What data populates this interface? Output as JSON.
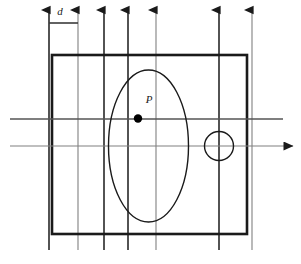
{
  "figure": {
    "labels": {
      "spacing_label": "d",
      "point_label": "P"
    },
    "colors": {
      "heavy_stroke": "#1a1a1a",
      "light_stroke": "#808080",
      "medium_stroke": "#555555",
      "point_fill": "#000000",
      "background": "#ffffff"
    },
    "canvas": {
      "width": 301,
      "height": 264
    },
    "boundary_rect": {
      "name": "outer-boundary-rectangle",
      "x": 52,
      "y": 55,
      "width": 195,
      "height": 179,
      "stroke_width": 2.6
    },
    "ellipse": {
      "name": "ellipse-region",
      "cx": 148.5,
      "cy": 146,
      "rx": 40,
      "ry": 76,
      "stroke_width": 1.4
    },
    "hole_circle": {
      "name": "circular-hole",
      "cx": 219,
      "cy": 146,
      "r": 14.5,
      "stroke_width": 1.4
    },
    "point": {
      "name": "sample-point-P",
      "cx": 138,
      "cy": 118.5,
      "r": 4.2,
      "label_x": 149,
      "label_y": 103
    },
    "vertical_arrows": [
      {
        "x": 49,
        "top": 10,
        "bottom": 250,
        "weight": "heavy"
      },
      {
        "x": 78,
        "top": 10,
        "bottom": 250,
        "weight": "light"
      },
      {
        "x": 104,
        "top": 10,
        "bottom": 250,
        "weight": "heavy"
      },
      {
        "x": 128,
        "top": 10,
        "bottom": 250,
        "weight": "heavy"
      },
      {
        "x": 156,
        "top": 10,
        "bottom": 250,
        "weight": "light"
      },
      {
        "x": 219,
        "top": 10,
        "bottom": 250,
        "weight": "heavy"
      },
      {
        "x": 252,
        "top": 10,
        "bottom": 250,
        "weight": "light"
      }
    ],
    "horizontal_lines": [
      {
        "name": "scan-line-upper",
        "y": 119,
        "x1": 10,
        "x2": 283,
        "arrowhead": false,
        "weight": "medium"
      },
      {
        "name": "scan-line-lower",
        "y": 146,
        "x1": 10,
        "x2": 293,
        "arrowhead": true,
        "weight": "light"
      }
    ],
    "spacing_bar": {
      "name": "spacing-dimension-bar",
      "y": 23,
      "x1": 49,
      "x2": 78,
      "label_x": 60,
      "label_y": 15
    }
  }
}
